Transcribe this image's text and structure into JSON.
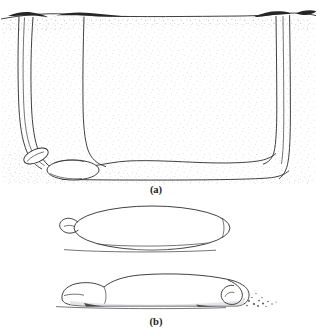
{
  "figure": {
    "panels": [
      {
        "id": "a",
        "caption": "(a)",
        "description": "Cross-section of U-shaped burrow in stippled sediment with two surface openings and organisms in lower-left chamber",
        "elements": {
          "left_opening": "funnel-entrance-left",
          "right_opening": "funnel-entrance-right",
          "shaft_left": "vertical-shaft-left",
          "shaft_right": "vertical-shaft-right",
          "chamber_floor": "burrow-floor",
          "organisms": [
            "organism-upper-chamber",
            "organism-lower-chamber"
          ],
          "sediment": "stippled-sediment-matrix"
        }
      },
      {
        "id": "b",
        "caption": "(b)",
        "description": "Two lateral views of the organism",
        "elements": {
          "upper_form": "organism-lateral-smooth",
          "lower_form": "organism-lateral-curled-tail",
          "debris": "sediment-debris-specks"
        }
      }
    ],
    "colors": {
      "ink": "#2b2b2b",
      "soil_dark": "#262626",
      "background": "#ffffff",
      "stipple": "#b9b9c4"
    }
  }
}
